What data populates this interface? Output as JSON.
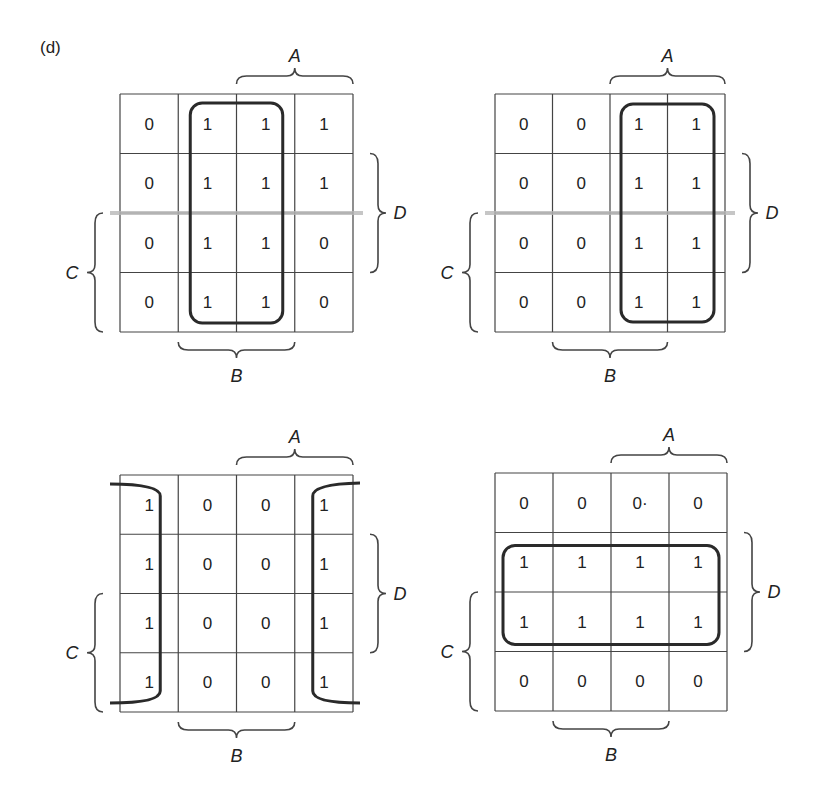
{
  "figure_label": "(d)",
  "colors": {
    "grid": "#444444",
    "loop": "#2a2a2a",
    "text": "#222222",
    "smudge": "#b8b8b8"
  },
  "maps": [
    {
      "id": "map-top-left",
      "origin": [
        120,
        94
      ],
      "cell_w": 58.25,
      "cell_h": 59.5,
      "cells": [
        [
          "0",
          "1",
          "1",
          "1"
        ],
        [
          "0",
          "1",
          "1",
          "1"
        ],
        [
          "0",
          "1",
          "1",
          "0"
        ],
        [
          "0",
          "1",
          "1",
          "0"
        ]
      ],
      "labels": {
        "A": "A",
        "B": "B",
        "C": "C",
        "D": "D"
      },
      "grouping": "vertical-center-columns",
      "smudge": true
    },
    {
      "id": "map-top-right",
      "origin": [
        495,
        94
      ],
      "cell_w": 57.5,
      "cell_h": 59.5,
      "cells": [
        [
          "0",
          "0",
          "1",
          "1"
        ],
        [
          "0",
          "0",
          "1",
          "1"
        ],
        [
          "0",
          "0",
          "1",
          "1"
        ],
        [
          "0",
          "0",
          "1",
          "1"
        ]
      ],
      "labels": {
        "A": "A",
        "B": "B",
        "C": "C",
        "D": "D"
      },
      "grouping": "vertical-right-columns",
      "smudge": true
    },
    {
      "id": "map-bottom-left",
      "origin": [
        120,
        475
      ],
      "cell_w": 58.25,
      "cell_h": 59.25,
      "cells": [
        [
          "1",
          "0",
          "0",
          "1"
        ],
        [
          "1",
          "0",
          "0",
          "1"
        ],
        [
          "1",
          "0",
          "0",
          "1"
        ],
        [
          "1",
          "0",
          "0",
          "1"
        ]
      ],
      "labels": {
        "A": "A",
        "B": "B",
        "C": "C",
        "D": "D"
      },
      "grouping": "wraparound-outer-columns",
      "smudge": false
    },
    {
      "id": "map-bottom-right",
      "origin": [
        495,
        473
      ],
      "cell_w": 58,
      "cell_h": 59.5,
      "cells": [
        [
          "0",
          "0",
          "0·",
          "0"
        ],
        [
          "1",
          "1",
          "1",
          "1"
        ],
        [
          "1",
          "1",
          "1",
          "1"
        ],
        [
          "0",
          "0",
          "0",
          "0"
        ]
      ],
      "labels": {
        "A": "A",
        "B": "B",
        "C": "C",
        "D": "D"
      },
      "grouping": "horizontal-middle-rows",
      "smudge": false
    }
  ]
}
